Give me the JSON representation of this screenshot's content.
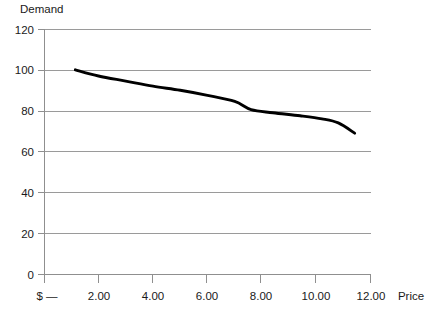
{
  "chart_data": {
    "type": "line",
    "title": "",
    "ylabel": "Demand",
    "xlabel": "Price",
    "grid": "horizontal",
    "legend": "none",
    "xlim": [
      0,
      12
    ],
    "ylim": [
      0,
      120
    ],
    "x_tick_labels": [
      "$ —",
      "2.00",
      "4.00",
      "6.00",
      "8.00",
      "10.00",
      "12.00"
    ],
    "x_tick_values": [
      0,
      2,
      4,
      6,
      8,
      10,
      12
    ],
    "y_tick_labels": [
      "0",
      "20",
      "40",
      "60",
      "80",
      "100",
      "120"
    ],
    "y_tick_values": [
      0,
      20,
      40,
      60,
      80,
      100,
      120
    ],
    "series": [
      {
        "name": "Demand",
        "color": "#000000",
        "x": [
          1.15,
          2.0,
          3.0,
          4.0,
          5.0,
          6.0,
          7.0,
          7.6,
          8.4,
          9.4,
          10.2,
          10.8,
          11.4
        ],
        "values": [
          100,
          97,
          94.5,
          92,
          90,
          87.5,
          84.5,
          80.5,
          79,
          77.5,
          76,
          74,
          69
        ]
      }
    ]
  },
  "axes": {
    "y_axis_title": "Demand",
    "x_axis_title": "Price",
    "currency_tick": "$ —"
  },
  "colors": {
    "line": "#000000",
    "grid": "#9a9a9a",
    "axis": "#8f8f8f",
    "background": "#ffffff",
    "text": "#1a1a1a"
  }
}
